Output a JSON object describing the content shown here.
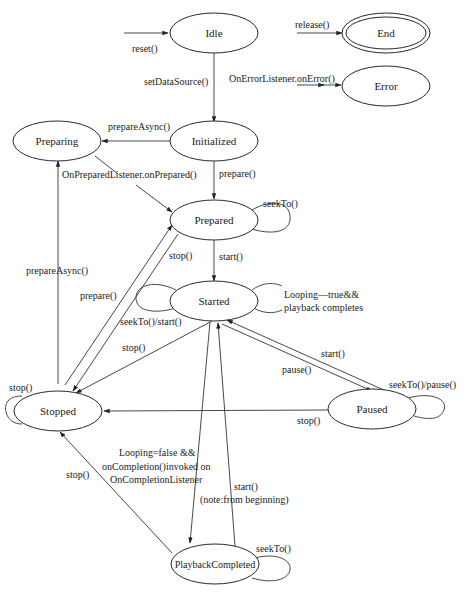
{
  "diagram": {
    "type": "state-machine",
    "states": [
      {
        "id": "idle",
        "label": "Idle"
      },
      {
        "id": "end",
        "label": "End"
      },
      {
        "id": "error",
        "label": "Error"
      },
      {
        "id": "initialized",
        "label": "Initialized"
      },
      {
        "id": "preparing",
        "label": "Preparing"
      },
      {
        "id": "prepared",
        "label": "Prepared"
      },
      {
        "id": "started",
        "label": "Started"
      },
      {
        "id": "stopped",
        "label": "Stopped"
      },
      {
        "id": "paused",
        "label": "Paused"
      },
      {
        "id": "playback_completed",
        "label": "PlaybackCompleted"
      }
    ],
    "transitions": [
      {
        "from": "(any)",
        "to": "Idle",
        "label": "reset()"
      },
      {
        "from": "(any)",
        "to": "End",
        "label": "release()"
      },
      {
        "from": "(any)",
        "to": "Error",
        "label": "OnErrorListener.onError()"
      },
      {
        "from": "Idle",
        "to": "Initialized",
        "label": "setDataSource()"
      },
      {
        "from": "Initialized",
        "to": "Preparing",
        "label": "prepareAsync()"
      },
      {
        "from": "Initialized",
        "to": "Prepared",
        "label": "prepare()"
      },
      {
        "from": "Preparing",
        "to": "Prepared",
        "label": "OnPreparedListener.onPrepared()"
      },
      {
        "from": "Prepared",
        "to": "Prepared",
        "label": "seekTo()"
      },
      {
        "from": "Prepared",
        "to": "Started",
        "label": "start()"
      },
      {
        "from": "Prepared",
        "to": "Stopped",
        "label": "stop()"
      },
      {
        "from": "Stopped",
        "to": "Prepared",
        "label": "prepare()"
      },
      {
        "from": "Stopped",
        "to": "Preparing",
        "label": "prepareAsync()"
      },
      {
        "from": "Stopped",
        "to": "Stopped",
        "label": "stop()"
      },
      {
        "from": "Started",
        "to": "Started",
        "label": "seekTo()/start()"
      },
      {
        "from": "Started",
        "to": "Started",
        "label": "Looping—true&& playback completes"
      },
      {
        "from": "Started",
        "to": "Stopped",
        "label": "stop()"
      },
      {
        "from": "Started",
        "to": "Paused",
        "label": "pause()"
      },
      {
        "from": "Paused",
        "to": "Started",
        "label": "start()"
      },
      {
        "from": "Paused",
        "to": "Paused",
        "label": "seekTo()/pause()"
      },
      {
        "from": "Paused",
        "to": "Stopped",
        "label": "stop()"
      },
      {
        "from": "Started",
        "to": "PlaybackCompleted",
        "label": "Looping=false && onCompletion()invoked on OnCompletionListener"
      },
      {
        "from": "PlaybackCompleted",
        "to": "Started",
        "label": "start() (note:from beginning)"
      },
      {
        "from": "PlaybackCompleted",
        "to": "PlaybackCompleted",
        "label": "seekTo()"
      },
      {
        "from": "PlaybackCompleted",
        "to": "Stopped",
        "label": "stop()"
      }
    ]
  },
  "labels": {
    "states": {
      "idle": "Idle",
      "end": "End",
      "error": "Error",
      "initialized": "Initialized",
      "preparing": "Preparing",
      "prepared": "Prepared",
      "started": "Started",
      "stopped": "Stopped",
      "paused": "Paused",
      "playback_completed": "PlaybackCompleted"
    },
    "edges": {
      "reset": "reset()",
      "release": "release()",
      "on_error": "OnErrorListener.onError()",
      "set_data_source": "setDataSource()",
      "prepare_async_init": "prepareAsync()",
      "on_prepared": "OnPreparedListener.onPrepared()",
      "prepare_init": "prepare()",
      "prepared_seek": "seekTo()",
      "prepared_start": "start()",
      "prepared_stop": "stop()",
      "prepare_async_stopped": "prepareAsync()",
      "prepare_stopped": "prepare()",
      "started_seek_start": "seekTo()/start()",
      "looping_line1": "Looping—true&&",
      "looping_line2": "playback completes",
      "started_stop": "stop()",
      "paused_start": "start()",
      "started_pause": "pause()",
      "paused_seek_pause": "seekTo()/pause()",
      "stopped_self": "stop()",
      "paused_stop": "stop()",
      "completion_line1": "Looping=false &&",
      "completion_line2": "onCompletion()invoked on",
      "completion_line3": "OnCompletionListener",
      "completed_stop": "stop()",
      "completed_start_line1": "start()",
      "completed_start_line2": "(note:from beginning)",
      "completed_seek": "seekTo()"
    }
  }
}
